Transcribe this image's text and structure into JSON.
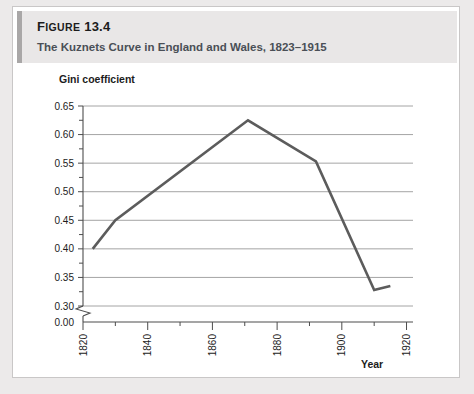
{
  "figure": {
    "number_prefix": "F",
    "number_word": "IGURE",
    "number": "13.4",
    "subtitle": "The Kuznets Curve in England and Wales, 1823–1915"
  },
  "colors": {
    "accent_bar": "#a9a7a7",
    "header_bg": "#e9e7e7",
    "series_line": "#5c5c5c",
    "gridline": "#8d8d8d",
    "axis": "#4d4d4d",
    "page_bg": "#eceaea",
    "card_bg": "#ffffff",
    "subtitle_text": "#4a4f56"
  },
  "chart_data": {
    "type": "line",
    "title": "The Kuznets Curve in England and Wales, 1823–1915",
    "xlabel": "Year",
    "ylabel": "Gini coefficient",
    "xlim": [
      1820,
      1922
    ],
    "ylim": [
      0.3,
      0.65
    ],
    "y_axis_break": true,
    "y_break_label": "0.00",
    "grid": "horizontal",
    "legend": "none",
    "x_ticks_major": [
      "1820",
      "1840",
      "1860",
      "1880",
      "1900",
      "1920"
    ],
    "x_tick_values": [
      1820,
      1840,
      1860,
      1880,
      1900,
      1920
    ],
    "x_ticks_minor": [
      1830,
      1850,
      1870,
      1890,
      1910
    ],
    "y_ticks_major": [
      "0.65",
      "0.60",
      "0.55",
      "0.50",
      "0.45",
      "0.40",
      "0.35",
      "0.30",
      "0.00"
    ],
    "y_tick_values": [
      0.65,
      0.6,
      0.55,
      0.5,
      0.45,
      0.4,
      0.35,
      0.3
    ],
    "y_ticks_minor": [
      0.625,
      0.575,
      0.525,
      0.475,
      0.425,
      0.375,
      0.325
    ],
    "series": [
      {
        "name": "Gini coefficient",
        "x": [
          1823,
          1830,
          1871,
          1892,
          1910,
          1915
        ],
        "values": [
          0.4,
          0.45,
          0.625,
          0.553,
          0.328,
          0.335
        ]
      }
    ]
  }
}
